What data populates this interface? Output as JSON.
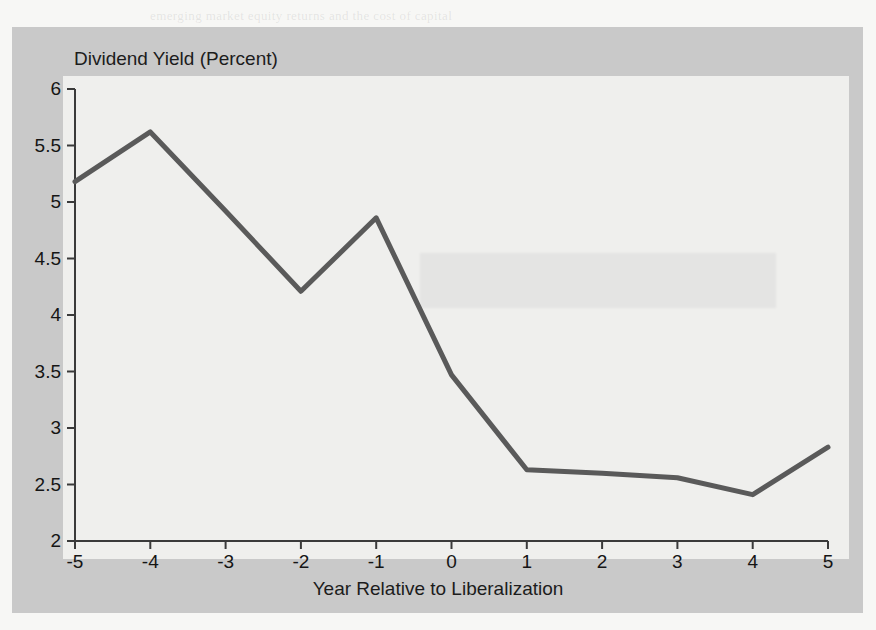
{
  "figure": {
    "title": "Dividend Yield (Percent)",
    "xlabel": "Year Relative to Liberalization",
    "line_color": "#5a5a5a",
    "axis_color": "#3a3a3a",
    "frame_color": "#c9c9c9",
    "canvas_color": "#efefed"
  },
  "ghost_lines": [
    {
      "text": "emerging market equity returns and the cost of capital",
      "x": 150,
      "y": 8
    },
    {
      "text": "a substantial reduction in the aggregate dividend yield",
      "x": 95,
      "y": 92
    },
    {
      "text": "in the years immediately following a liberalization",
      "x": 140,
      "y": 118
    },
    {
      "text": "event. The decline of roughly 250 basis points in the",
      "x": 110,
      "y": 144
    },
    {
      "text": "dividend yield is consistent with a decrease in the",
      "x": 88,
      "y": 170
    },
    {
      "text": "cost of equity capital implied by the integration",
      "x": 120,
      "y": 196
    },
    {
      "text": "of the local market with world capital markets.",
      "x": 150,
      "y": 222
    },
    {
      "text": "Figure 2 plots the average dividend yield across",
      "x": 62,
      "y": 248
    },
    {
      "text": "the sample of liberalizing countries in event time.",
      "x": 70,
      "y": 274
    },
    {
      "text": "The yield falls from above five percent to below",
      "x": 82,
      "y": 300
    },
    {
      "text": "three percent within two years of the reform.",
      "x": 160,
      "y": 326
    },
    {
      "text": "standard errors are clustered by country",
      "x": 230,
      "y": 352
    },
    {
      "text": "These results are robust to the inclusion",
      "x": 96,
      "y": 378
    },
    {
      "text": "of country fixed effects and year effects",
      "x": 120,
      "y": 404
    }
  ],
  "chart_data": {
    "type": "line",
    "title": "Dividend Yield (Percent)",
    "xlabel": "Year Relative to Liberalization",
    "ylabel": "Dividend Yield (Percent)",
    "x": [
      -5,
      -4,
      -3,
      -2,
      -1,
      0,
      1,
      2,
      3,
      4,
      5
    ],
    "values": [
      5.18,
      5.62,
      4.92,
      4.21,
      4.86,
      3.47,
      2.63,
      2.6,
      2.56,
      2.41,
      2.83
    ],
    "series": [
      {
        "name": "Dividend Yield",
        "values": [
          5.18,
          5.62,
          4.92,
          4.21,
          4.86,
          3.47,
          2.63,
          2.6,
          2.56,
          2.41,
          2.83
        ]
      }
    ],
    "xlim": [
      -5,
      5
    ],
    "ylim": [
      2,
      6
    ],
    "xticks": [
      -5,
      -4,
      -3,
      -2,
      -1,
      0,
      1,
      2,
      3,
      4,
      5
    ],
    "xtick_labels": [
      "-5",
      "-4",
      "-3",
      "-2",
      "-1",
      "0",
      "1",
      "2",
      "3",
      "4",
      "5"
    ],
    "yticks": [
      2,
      2.5,
      3,
      3.5,
      4,
      4.5,
      5,
      5.5,
      6
    ],
    "ytick_labels": [
      "2",
      "2.5",
      "3",
      "3.5",
      "4",
      "4.5",
      "5",
      "5.5",
      "6"
    ],
    "grid": false,
    "legend": false,
    "legend_position": "none"
  }
}
